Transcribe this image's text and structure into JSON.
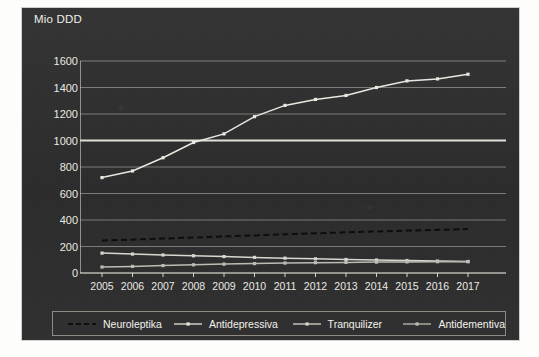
{
  "chart_data": {
    "type": "line",
    "title": "",
    "ylabel": "Mio DDD",
    "xlabel": "",
    "ylim": [
      0,
      1600
    ],
    "ytick_step": 200,
    "grid": true,
    "legend_position": "bottom",
    "categories": [
      "2005",
      "2006",
      "2007",
      "2008",
      "2009",
      "2010",
      "2011",
      "2012",
      "2013",
      "2014",
      "2015",
      "2016",
      "2017"
    ],
    "series": [
      {
        "name": "Neuroleptika",
        "style": "dashed",
        "color": "#0d0d0d",
        "values": [
          245,
          252,
          260,
          268,
          276,
          284,
          292,
          300,
          307,
          314,
          320,
          326,
          332
        ]
      },
      {
        "name": "Antidepressiva",
        "style": "solid-markers",
        "color": "#e8e8e0",
        "values": [
          720,
          770,
          870,
          985,
          1050,
          1180,
          1265,
          1310,
          1340,
          1400,
          1450,
          1465,
          1500
        ]
      },
      {
        "name": "Tranquilizer",
        "style": "solid-markers",
        "color": "#d8d8d0",
        "values": [
          150,
          143,
          136,
          130,
          124,
          118,
          112,
          107,
          102,
          98,
          94,
          90,
          87
        ]
      },
      {
        "name": "Antidementiva",
        "style": "solid-markers",
        "color": "#bdbdb5",
        "values": [
          45,
          50,
          56,
          62,
          67,
          71,
          75,
          78,
          80,
          82,
          84,
          85,
          85
        ]
      }
    ],
    "ytick_labels": [
      "0",
      "200",
      "400",
      "600",
      "800",
      "1000",
      "1200",
      "1400",
      "1600"
    ],
    "colors": {
      "panel_background": "#2f2f2f",
      "grid": "#b9b9b2",
      "axis": "#d5d5cd",
      "text": "#eeeee8",
      "highlight_gridline": "#e9e9e1"
    }
  },
  "legend": {
    "items": [
      {
        "label": "Neuroleptika"
      },
      {
        "label": "Antidepressiva"
      },
      {
        "label": "Tranquilizer"
      },
      {
        "label": "Antidementiva"
      }
    ]
  }
}
